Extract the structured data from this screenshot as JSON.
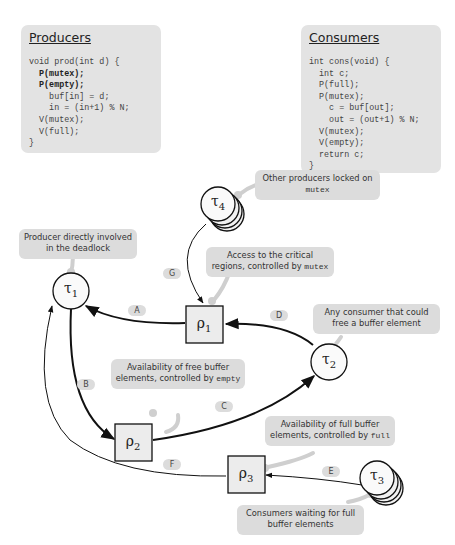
{
  "producers": {
    "title": "Producers",
    "code": [
      {
        "text": "void prod(int d) {",
        "bold": false,
        "indent": 0
      },
      {
        "text": "P(mutex);",
        "bold": true,
        "indent": 1
      },
      {
        "text": "P(empty);",
        "bold": true,
        "indent": 1
      },
      {
        "text": "buf[in] = d;",
        "bold": false,
        "indent": 2
      },
      {
        "text": "in = (in+1) % N;",
        "bold": false,
        "indent": 2
      },
      {
        "text": "V(mutex);",
        "bold": false,
        "indent": 1
      },
      {
        "text": "V(full);",
        "bold": false,
        "indent": 1
      },
      {
        "text": "}",
        "bold": false,
        "indent": 0
      }
    ]
  },
  "consumers": {
    "title": "Consumers",
    "code": [
      {
        "text": "int cons(void) {",
        "bold": false,
        "indent": 0
      },
      {
        "text": "int c;",
        "bold": false,
        "indent": 1
      },
      {
        "text": "P(full);",
        "bold": false,
        "indent": 1
      },
      {
        "text": "P(mutex);",
        "bold": false,
        "indent": 1
      },
      {
        "text": "c = buf[out];",
        "bold": false,
        "indent": 2
      },
      {
        "text": "out = (out+1) % N;",
        "bold": false,
        "indent": 2
      },
      {
        "text": "V(mutex);",
        "bold": false,
        "indent": 1
      },
      {
        "text": "V(empty);",
        "bold": false,
        "indent": 1
      },
      {
        "text": "return c;",
        "bold": false,
        "indent": 1
      },
      {
        "text": "}",
        "bold": false,
        "indent": 0
      }
    ]
  },
  "nodes": {
    "tau1": {
      "symbol": "τ",
      "sub": "1",
      "kind": "task"
    },
    "tau2": {
      "symbol": "τ",
      "sub": "2",
      "kind": "task"
    },
    "tau3": {
      "symbol": "τ",
      "sub": "3",
      "kind": "task-group"
    },
    "tau4": {
      "symbol": "τ",
      "sub": "4",
      "kind": "task-group"
    },
    "rho1": {
      "symbol": "ρ",
      "sub": "1",
      "kind": "resource"
    },
    "rho2": {
      "symbol": "ρ",
      "sub": "2",
      "kind": "resource"
    },
    "rho3": {
      "symbol": "ρ",
      "sub": "3",
      "kind": "resource"
    }
  },
  "edges": [
    {
      "label": "A",
      "from": "rho1",
      "to": "tau1"
    },
    {
      "label": "B",
      "from": "tau1",
      "to": "rho2"
    },
    {
      "label": "C",
      "from": "rho2",
      "to": "tau2"
    },
    {
      "label": "D",
      "from": "tau2",
      "to": "rho1"
    },
    {
      "label": "E",
      "from": "tau3",
      "to": "rho3"
    },
    {
      "label": "F",
      "from": "rho3",
      "to": "tau1"
    },
    {
      "label": "G",
      "from": "tau4",
      "to": "rho1"
    }
  ],
  "callouts": {
    "tau4": {
      "text": "Other producers locked on",
      "code": "mutex"
    },
    "tau1": {
      "text": "Producer directly involved in the deadlock",
      "code": ""
    },
    "rho1": {
      "text": "Access to the critical regions, controlled by",
      "code": "mutex"
    },
    "tau2": {
      "text": "Any consumer that could free a buffer element",
      "code": ""
    },
    "rho2": {
      "text": "Availability of free buffer elements, controlled by",
      "code": "empty"
    },
    "rho3": {
      "text": "Availability of full buffer elements, controlled by",
      "code": "full"
    },
    "tau3": {
      "text": "Consumers waiting for full buffer elements",
      "code": ""
    }
  }
}
